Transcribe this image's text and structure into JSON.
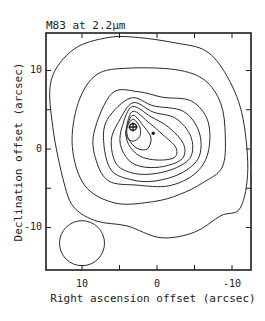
{
  "chart_data": {
    "type": "contour",
    "title": "M83 at 2.2µm",
    "xlabel": "Right ascension offset (arcsec)",
    "ylabel": "Declination offset (arcsec)",
    "xlim": [
      15,
      -12.5
    ],
    "ylim": [
      -15.5,
      14.7
    ],
    "x_axis_reversed": true,
    "x_ticks": [
      10,
      5,
      0,
      -5,
      -10
    ],
    "x_tick_labels": [
      "10",
      "",
      "0",
      "",
      "-10"
    ],
    "y_ticks": [
      10,
      5,
      0,
      -5,
      -10
    ],
    "y_tick_labels": [
      "10",
      "",
      "0",
      "",
      "-10"
    ],
    "grid": false,
    "legend": null,
    "contour_levels_count": 9,
    "nucleus_marker": {
      "symbol": "circle-cross",
      "x": 3.2,
      "y": 2.8
    },
    "secondary_marker": {
      "symbol": "dot",
      "x": 0.5,
      "y": 2.0
    },
    "beam": {
      "shape": "circle",
      "x": 10,
      "y": -12,
      "diameter": 6
    },
    "contours": [
      [
        [
          11.1,
          12.7
        ],
        [
          6.5,
          14.2
        ],
        [
          2.5,
          14.2
        ],
        [
          -2.5,
          13.5
        ],
        [
          -6.5,
          12.5
        ],
        [
          -9.2,
          9.5
        ],
        [
          -11.3,
          4.6
        ],
        [
          -12.1,
          -2.5
        ],
        [
          -11.1,
          -7.5
        ],
        [
          -8.5,
          -8.5
        ],
        [
          -5,
          -10.6
        ],
        [
          -0.5,
          -11.3
        ],
        [
          4,
          -9.8
        ],
        [
          8,
          -9.2
        ],
        [
          11,
          -7.5
        ],
        [
          12.4,
          -4.3
        ],
        [
          13.9,
          2.8
        ],
        [
          14.1,
          8.8
        ],
        [
          11.1,
          12.7
        ]
      ],
      [
        [
          8,
          9.5
        ],
        [
          3.7,
          10.3
        ],
        [
          -2.5,
          10.1
        ],
        [
          -6.3,
          8.8
        ],
        [
          -8.5,
          5.8
        ],
        [
          -9.1,
          1.7
        ],
        [
          -8.7,
          -2.3
        ],
        [
          -6.1,
          -4.3
        ],
        [
          -3,
          -5.8
        ],
        [
          0.5,
          -6.7
        ],
        [
          5.5,
          -6.9
        ],
        [
          9.6,
          -4.7
        ],
        [
          11.3,
          0.3
        ],
        [
          10.5,
          5.9
        ],
        [
          8,
          9.5
        ]
      ],
      [
        [
          6,
          7.1
        ],
        [
          2.5,
          7.3
        ],
        [
          -0.7,
          6.6
        ],
        [
          -4.6,
          6.1
        ],
        [
          -6.8,
          3.5
        ],
        [
          -6.8,
          -0.5
        ],
        [
          -5,
          -3.2
        ],
        [
          -1.5,
          -4.7
        ],
        [
          2.7,
          -4.6
        ],
        [
          6.4,
          -4.1
        ],
        [
          8.1,
          -1.5
        ],
        [
          8.4,
          2.1
        ],
        [
          6,
          7.1
        ]
      ],
      [
        [
          3.5,
          6.5
        ],
        [
          0.5,
          5.5
        ],
        [
          -3.5,
          4.8
        ],
        [
          -5.6,
          2.2
        ],
        [
          -5.6,
          -1
        ],
        [
          -3.2,
          -3.1
        ],
        [
          0.4,
          -4.1
        ],
        [
          3.5,
          -3.9
        ],
        [
          6.1,
          -2.7
        ],
        [
          7.1,
          0.7
        ],
        [
          6.6,
          3.8
        ],
        [
          3.5,
          6.5
        ]
      ],
      [
        [
          3.2,
          5.9
        ],
        [
          0.5,
          4.7
        ],
        [
          -2.5,
          3.9
        ],
        [
          -4.5,
          1.6
        ],
        [
          -4.5,
          -1
        ],
        [
          -2.3,
          -2.5
        ],
        [
          0.8,
          -3.2
        ],
        [
          3.5,
          -3
        ],
        [
          5.5,
          -1.8
        ],
        [
          6.1,
          1.1
        ],
        [
          5.1,
          3.5
        ],
        [
          3.2,
          5.9
        ]
      ],
      [
        [
          3.3,
          5.4
        ],
        [
          0.8,
          4.1
        ],
        [
          -1.5,
          2.8
        ],
        [
          -3.5,
          0.7
        ],
        [
          -3.4,
          -1.2
        ],
        [
          -1,
          -2.2
        ],
        [
          1.7,
          -2.3
        ],
        [
          3.7,
          -1.5
        ],
        [
          4.9,
          0.6
        ],
        [
          4.6,
          3
        ],
        [
          3.3,
          5.4
        ]
      ],
      [
        [
          3.2,
          4.8
        ],
        [
          1,
          3.3
        ],
        [
          -0.8,
          1.8
        ],
        [
          -2.5,
          0.2
        ],
        [
          -2.3,
          -1.1
        ],
        [
          0,
          -1.4
        ],
        [
          2.3,
          -0.9
        ],
        [
          3.8,
          0.6
        ],
        [
          4.1,
          2.5
        ],
        [
          3.2,
          4.8
        ]
      ],
      [
        [
          3.2,
          4.3
        ],
        [
          1.7,
          2.8
        ],
        [
          0.8,
          1.4
        ],
        [
          1.3,
          0
        ],
        [
          2.7,
          0.1
        ],
        [
          3.8,
          1.3
        ],
        [
          4,
          2.7
        ],
        [
          3.2,
          4.3
        ]
      ],
      [
        [
          3.2,
          3.8
        ],
        [
          2.3,
          2.8
        ],
        [
          2.3,
          1.6
        ],
        [
          3.2,
          1
        ],
        [
          4.1,
          1.6
        ],
        [
          4,
          2.8
        ],
        [
          3.2,
          3.8
        ]
      ]
    ]
  },
  "figure": {
    "title": "M83 at 2.2µm",
    "xlabel": "Right ascension offset (arcsec)",
    "ylabel": "Declination offset (arcsec)",
    "xtick_10": "10",
    "xtick_0": "0",
    "xtick_m10": "-10",
    "ytick_10": "10",
    "ytick_0": "0",
    "ytick_m10": "-10",
    "line_color": "#2a2a2a",
    "frame_color": "#1e1e1e"
  }
}
